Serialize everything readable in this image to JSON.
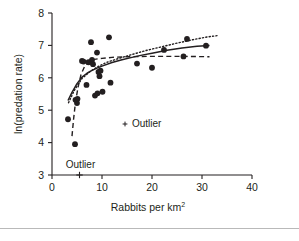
{
  "figure": {
    "background": "#ffffff",
    "ink_color": "#231f20",
    "rule_color": "#b9b9b9"
  },
  "annotations": {
    "legend_outlier": "Outlier",
    "axis_outlier": "Outlier",
    "outlier_marker": "cross-marker"
  },
  "chart_data": {
    "type": "scatter",
    "title": "",
    "xlabel": "Rabbits per km",
    "xlabel_superscript": "2",
    "ylabel": "ln(predation rate)",
    "xlim": [
      0,
      40
    ],
    "ylim": [
      3,
      8
    ],
    "xticks": [
      0,
      10,
      20,
      30,
      40
    ],
    "yticks": [
      3,
      4,
      5,
      6,
      7,
      8
    ],
    "xticklabels": [
      "0",
      "10",
      "20",
      "30",
      "40"
    ],
    "yticklabels": [
      "3",
      "4",
      "5",
      "6",
      "7",
      "8"
    ],
    "grid": false,
    "legend_position": "inside-center",
    "marker": {
      "shape": "circle",
      "color": "#231f20",
      "size": 5.2
    },
    "points": [
      {
        "x": 3.2,
        "y": 4.72
      },
      {
        "x": 4.6,
        "y": 3.95
      },
      {
        "x": 4.7,
        "y": 5.32
      },
      {
        "x": 5.0,
        "y": 5.22
      },
      {
        "x": 5.1,
        "y": 5.35
      },
      {
        "x": 6.0,
        "y": 6.52
      },
      {
        "x": 6.3,
        "y": 6.5
      },
      {
        "x": 6.9,
        "y": 5.78
      },
      {
        "x": 7.3,
        "y": 6.48
      },
      {
        "x": 7.8,
        "y": 7.1
      },
      {
        "x": 8.0,
        "y": 6.55
      },
      {
        "x": 8.2,
        "y": 6.42
      },
      {
        "x": 8.6,
        "y": 5.45
      },
      {
        "x": 9.0,
        "y": 6.78
      },
      {
        "x": 9.1,
        "y": 5.52
      },
      {
        "x": 9.3,
        "y": 6.18
      },
      {
        "x": 9.5,
        "y": 6.05
      },
      {
        "x": 9.7,
        "y": 6.22
      },
      {
        "x": 10.1,
        "y": 5.57
      },
      {
        "x": 11.4,
        "y": 7.25
      },
      {
        "x": 11.7,
        "y": 5.85
      },
      {
        "x": 17.0,
        "y": 6.44
      },
      {
        "x": 20.0,
        "y": 6.31
      },
      {
        "x": 22.4,
        "y": 6.86
      },
      {
        "x": 26.3,
        "y": 6.66
      },
      {
        "x": 27.0,
        "y": 7.2
      },
      {
        "x": 30.8,
        "y": 6.99
      }
    ],
    "outlier_point": {
      "x": 5.5,
      "y": 3.0,
      "marker": "cross"
    },
    "series": [
      {
        "name": "solid-fit",
        "style": "solid",
        "points": [
          {
            "x": 3.2,
            "y": 5.3
          },
          {
            "x": 4.0,
            "y": 5.55
          },
          {
            "x": 5.0,
            "y": 5.82
          },
          {
            "x": 6.0,
            "y": 6.02
          },
          {
            "x": 7.0,
            "y": 6.14
          },
          {
            "x": 8.0,
            "y": 6.23
          },
          {
            "x": 9.0,
            "y": 6.3
          },
          {
            "x": 10.0,
            "y": 6.36
          },
          {
            "x": 12.0,
            "y": 6.47
          },
          {
            "x": 14.0,
            "y": 6.56
          },
          {
            "x": 16.0,
            "y": 6.63
          },
          {
            "x": 18.0,
            "y": 6.7
          },
          {
            "x": 20.0,
            "y": 6.76
          },
          {
            "x": 23.0,
            "y": 6.85
          },
          {
            "x": 26.0,
            "y": 6.92
          },
          {
            "x": 29.0,
            "y": 6.97
          },
          {
            "x": 31.5,
            "y": 7.0
          }
        ]
      },
      {
        "name": "dotted-fit",
        "style": "dotted",
        "points": [
          {
            "x": 3.3,
            "y": 5.23
          },
          {
            "x": 4.5,
            "y": 5.62
          },
          {
            "x": 6.0,
            "y": 5.98
          },
          {
            "x": 7.5,
            "y": 6.18
          },
          {
            "x": 9.0,
            "y": 6.33
          },
          {
            "x": 11.0,
            "y": 6.48
          },
          {
            "x": 13.0,
            "y": 6.58
          },
          {
            "x": 16.0,
            "y": 6.72
          },
          {
            "x": 19.0,
            "y": 6.85
          },
          {
            "x": 22.0,
            "y": 6.96
          },
          {
            "x": 25.0,
            "y": 7.07
          },
          {
            "x": 28.0,
            "y": 7.17
          },
          {
            "x": 31.0,
            "y": 7.26
          },
          {
            "x": 33.0,
            "y": 7.3
          }
        ]
      },
      {
        "name": "dashed-fit",
        "style": "dashed",
        "points": [
          {
            "x": 4.0,
            "y": 4.2
          },
          {
            "x": 4.3,
            "y": 4.7
          },
          {
            "x": 4.7,
            "y": 5.25
          },
          {
            "x": 5.2,
            "y": 5.7
          },
          {
            "x": 5.8,
            "y": 6.1
          },
          {
            "x": 6.6,
            "y": 6.38
          },
          {
            "x": 7.5,
            "y": 6.52
          },
          {
            "x": 8.5,
            "y": 6.57
          },
          {
            "x": 10.0,
            "y": 6.6
          },
          {
            "x": 12.0,
            "y": 6.63
          },
          {
            "x": 15.0,
            "y": 6.65
          },
          {
            "x": 19.0,
            "y": 6.66
          },
          {
            "x": 23.0,
            "y": 6.66
          },
          {
            "x": 27.0,
            "y": 6.66
          },
          {
            "x": 31.5,
            "y": 6.65
          }
        ]
      }
    ]
  }
}
